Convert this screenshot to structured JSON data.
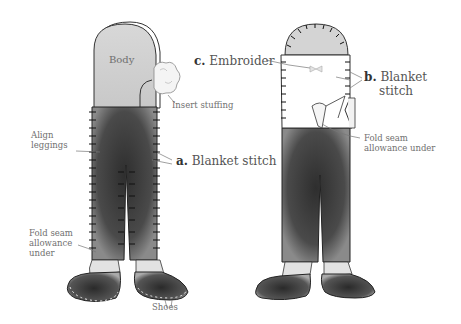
{
  "labels": {
    "body": "Body",
    "insert_stuffing": "Insert stuffing",
    "align_leggings_1": "Align",
    "align_leggings_2": "leggings",
    "step_a_letter": "a.",
    "step_a_text": "Blanket stitch",
    "fold_left_1": "Fold seam",
    "fold_left_2": "allowance",
    "fold_left_3": "under",
    "shoes": "Shoes",
    "step_c_letter": "c.",
    "step_c_text": "Embroider",
    "step_b_letter": "b.",
    "step_b_text_1": "Blanket",
    "step_b_text_2": "stitch",
    "fold_right_1": "Fold seam",
    "fold_right_2": "allowance under"
  },
  "colors": {
    "body_fill": "#cfcfcf",
    "legging_fill": "#3a3a3a",
    "shoe_fill": "#4a4a4a",
    "outline": "#2b2b2b",
    "label_text": "#6f6f6f",
    "background": "#ffffff"
  }
}
